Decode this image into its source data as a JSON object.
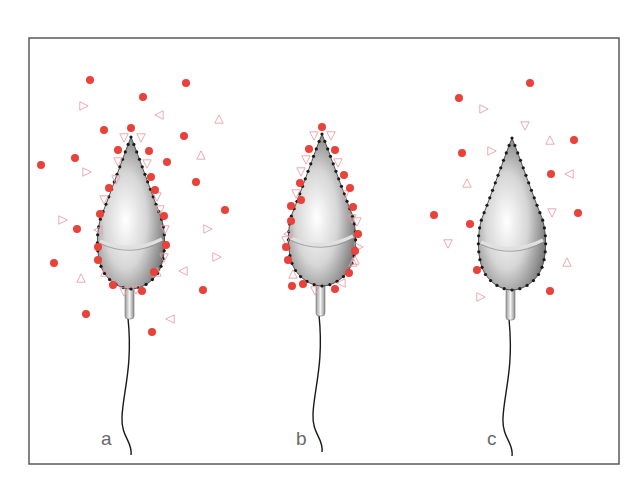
{
  "figure": {
    "panels": [
      {
        "id": "a",
        "label": "a",
        "cx": 131,
        "tipY": 137,
        "dots": [
          [
            90,
            80
          ],
          [
            186,
            83
          ],
          [
            143,
            97
          ],
          [
            104,
            130
          ],
          [
            131,
            128
          ],
          [
            184,
            136
          ],
          [
            75,
            158
          ],
          [
            41,
            165
          ],
          [
            118,
            150
          ],
          [
            149,
            151
          ],
          [
            167,
            162
          ],
          [
            151,
            177
          ],
          [
            196,
            182
          ],
          [
            109,
            188
          ],
          [
            155,
            190
          ],
          [
            225,
            210
          ],
          [
            100,
            214
          ],
          [
            164,
            216
          ],
          [
            77,
            229
          ],
          [
            98,
            247
          ],
          [
            166,
            245
          ],
          [
            98,
            260
          ],
          [
            54,
            263
          ],
          [
            154,
            272
          ],
          [
            113,
            285
          ],
          [
            142,
            291
          ],
          [
            203,
            290
          ],
          [
            86,
            314
          ],
          [
            152,
            332
          ]
        ],
        "triangles": [
          [
            84,
            106,
            "r"
          ],
          [
            159,
            115,
            "l"
          ],
          [
            219,
            119,
            "u"
          ],
          [
            124,
            138,
            "d"
          ],
          [
            141,
            138,
            "d"
          ],
          [
            201,
            155,
            "u"
          ],
          [
            87,
            172,
            "r"
          ],
          [
            118,
            162,
            "d"
          ],
          [
            147,
            164,
            "d"
          ],
          [
            116,
            180,
            "d"
          ],
          [
            157,
            197,
            "d"
          ],
          [
            104,
            200,
            "d"
          ],
          [
            160,
            210,
            "d"
          ],
          [
            63,
            220,
            "r"
          ],
          [
            98,
            230,
            "l"
          ],
          [
            165,
            230,
            "d"
          ],
          [
            208,
            229,
            "r"
          ],
          [
            164,
            258,
            "d"
          ],
          [
            217,
            257,
            "r"
          ],
          [
            81,
            278,
            "u"
          ],
          [
            105,
            272,
            "u"
          ],
          [
            157,
            272,
            "u"
          ],
          [
            183,
            271,
            "l"
          ],
          [
            124,
            292,
            "d"
          ],
          [
            136,
            290,
            "d"
          ],
          [
            170,
            319,
            "l"
          ]
        ]
      },
      {
        "id": "b",
        "label": "b",
        "cx": 322,
        "tipY": 134,
        "dots": [
          [
            322,
            127
          ],
          [
            309,
            149
          ],
          [
            335,
            150
          ],
          [
            300,
            183
          ],
          [
            344,
            175
          ],
          [
            301,
            200
          ],
          [
            350,
            188
          ],
          [
            291,
            206
          ],
          [
            353,
            207
          ],
          [
            291,
            221
          ],
          [
            358,
            234
          ],
          [
            286,
            247
          ],
          [
            288,
            260
          ],
          [
            355,
            251
          ],
          [
            349,
            273
          ],
          [
            292,
            286
          ],
          [
            303,
            284
          ],
          [
            335,
            289
          ]
        ],
        "triangles": [
          [
            314,
            136,
            "d"
          ],
          [
            331,
            136,
            "d"
          ],
          [
            306,
            160,
            "d"
          ],
          [
            338,
            163,
            "d"
          ],
          [
            301,
            172,
            "d"
          ],
          [
            345,
            195,
            "d"
          ],
          [
            296,
            194,
            "d"
          ],
          [
            352,
            219,
            "d"
          ],
          [
            288,
            234,
            "l"
          ],
          [
            357,
            222,
            "d"
          ],
          [
            286,
            241,
            "d"
          ],
          [
            359,
            247,
            "r"
          ],
          [
            355,
            260,
            "u"
          ],
          [
            293,
            274,
            "u"
          ],
          [
            341,
            283,
            "l"
          ],
          [
            315,
            291,
            "d"
          ],
          [
            353,
            262,
            "u"
          ]
        ]
      },
      {
        "id": "c",
        "label": "c",
        "cx": 512,
        "tipY": 138,
        "dots": [
          [
            530,
            83
          ],
          [
            459,
            98
          ],
          [
            462,
            153
          ],
          [
            574,
            140
          ],
          [
            551,
            174
          ],
          [
            578,
            213
          ],
          [
            434,
            215
          ],
          [
            470,
            224
          ],
          [
            477,
            270
          ],
          [
            550,
            291
          ]
        ],
        "triangles": [
          [
            484,
            109,
            "r"
          ],
          [
            525,
            126,
            "d"
          ],
          [
            492,
            151,
            "r"
          ],
          [
            550,
            140,
            "u"
          ],
          [
            467,
            183,
            "u"
          ],
          [
            569,
            174,
            "l"
          ],
          [
            552,
            213,
            "d"
          ],
          [
            448,
            244,
            "d"
          ],
          [
            567,
            262,
            "u"
          ],
          [
            481,
            297,
            "r"
          ]
        ]
      }
    ],
    "colors": {
      "dot": "#e8423a",
      "triangle_stroke": "#e9a0a8",
      "frame": "#555555",
      "outline_dots": "#1a1a1a",
      "tail": "#1a1a1a"
    }
  }
}
